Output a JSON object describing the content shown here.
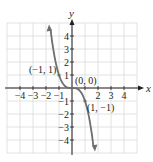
{
  "chart_data": {
    "type": "line",
    "title": "",
    "xlabel": "x",
    "ylabel": "y",
    "xlim": [
      -5,
      5
    ],
    "ylim": [
      -5,
      5
    ],
    "grid": true,
    "x_ticks": [
      -4,
      -3,
      -2,
      -1,
      1,
      2,
      3,
      4
    ],
    "x_tick_labels": [
      "−4",
      "−3",
      "−2",
      "−1",
      "",
      "2",
      "3",
      "4"
    ],
    "y_ticks": [
      4,
      3,
      2,
      1,
      -1,
      -2,
      -3,
      -4
    ],
    "y_tick_labels": [
      "4",
      "3",
      "2",
      "1",
      "−1",
      "−2",
      "−3",
      "−4"
    ],
    "series": [
      {
        "name": "y = -x^3",
        "color": "#6d6e71",
        "function": "-x^3",
        "x_range": [
          -1.65,
          1.65
        ],
        "arrows": "both"
      }
    ],
    "annotations": [
      {
        "label": "(−1, 1)",
        "x": -1,
        "y": 1
      },
      {
        "label": "(0, 0)",
        "x": 0,
        "y": 0
      },
      {
        "label": "(1, −1)",
        "x": 1,
        "y": -1
      }
    ]
  },
  "colors": {
    "grid": "#d9dadb",
    "axis": "#231f20",
    "curve": "#6d6e71",
    "text": "#231f20"
  }
}
